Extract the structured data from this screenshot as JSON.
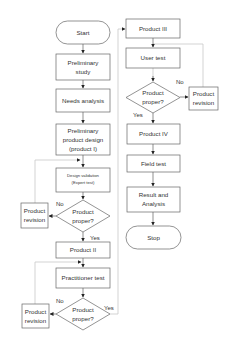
{
  "diagram": {
    "type": "flowchart",
    "colors": {
      "box_stroke": "#666666",
      "text": "#333333",
      "connector": "#444444",
      "loop_line": "#c8c8c8",
      "background": "#ffffff"
    },
    "nodes": {
      "start": {
        "label": "Start",
        "shape": "terminator"
      },
      "preliminary_study": {
        "line1": "Preliminary",
        "line2": "study",
        "shape": "process"
      },
      "needs_analysis": {
        "label": "Needs analysis",
        "shape": "process"
      },
      "preliminary_design": {
        "line1": "Preliminary",
        "line2": "product design",
        "line3": "(product I)",
        "shape": "process"
      },
      "design_validation": {
        "line1": "Design validation",
        "line2": "(Expert test)",
        "shape": "process"
      },
      "decision1": {
        "line1": "Product",
        "line2": "proper?",
        "shape": "decision"
      },
      "revision1": {
        "line1": "Product",
        "line2": "revision",
        "shape": "process"
      },
      "product2": {
        "label": "Product II",
        "shape": "process"
      },
      "practitioner_test": {
        "label": "Practitioner test",
        "shape": "process"
      },
      "decision2": {
        "line1": "Product",
        "line2": "proper?",
        "shape": "decision"
      },
      "revision2": {
        "line1": "Product",
        "line2": "revision",
        "shape": "process"
      },
      "product3": {
        "label": "Product III",
        "shape": "process"
      },
      "user_test": {
        "label": "User test",
        "shape": "process"
      },
      "decision3": {
        "line1": "Product",
        "line2": "proper?",
        "shape": "decision"
      },
      "revision3": {
        "line1": "Product",
        "line2": "revision",
        "shape": "process"
      },
      "product4": {
        "label": "Product IV",
        "shape": "process"
      },
      "field_test": {
        "label": "Field test",
        "shape": "process"
      },
      "result_analysis": {
        "line1": "Result and",
        "line2": "Analysis",
        "shape": "process"
      },
      "stop": {
        "label": "Stop",
        "shape": "terminator"
      }
    },
    "edge_labels": {
      "d1_no": "No",
      "d1_yes": "Yes",
      "d2_no": "No",
      "d2_yes": "Yes",
      "d3_no": "No",
      "d3_yes": "Yes"
    }
  }
}
